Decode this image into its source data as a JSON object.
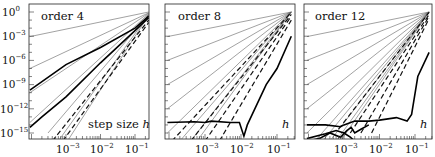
{
  "chart_data": [
    {
      "type": "line",
      "title": "order 4",
      "xlabel": "step size h",
      "ylabel": "",
      "xscale": "log",
      "yscale": "log",
      "xlim": [
        8.5e-05,
        0.25
      ],
      "ylim": [
        1e-16,
        10
      ],
      "x_ticks": [
        "10^-3",
        "10^-2",
        "10^-1"
      ],
      "y_ticks": [
        "10^0",
        "10^-3",
        "10^-6",
        "10^-9",
        "10^-12",
        "10^-15"
      ],
      "grid": false,
      "series": [
        {
          "name": "thin slope 1",
          "style": "thin",
          "slope": 1,
          "x": [
            9e-05,
            0.25
          ],
          "y": [
            0.0009,
            1.0
          ]
        },
        {
          "name": "thin slope 2",
          "style": "thin",
          "slope": 2,
          "x": [
            9e-05,
            0.25
          ],
          "y": [
            1e-07,
            0.8
          ]
        },
        {
          "name": "thin slope 3",
          "style": "thin",
          "slope": 3,
          "x": [
            9e-05,
            0.25
          ],
          "y": [
            1e-10,
            0.7
          ]
        },
        {
          "name": "thin slope 4",
          "style": "thin",
          "slope": 4,
          "x": [
            9e-05,
            0.25
          ],
          "y": [
            2e-14,
            0.6
          ]
        },
        {
          "name": "thin slope 5",
          "style": "thin",
          "slope": 5,
          "x": [
            0.0003,
            0.25
          ],
          "y": [
            1e-15,
            0.5
          ]
        },
        {
          "name": "thin slope 6",
          "style": "thin",
          "slope": 6,
          "x": [
            0.0006,
            0.25
          ],
          "y": [
            1e-16,
            0.5
          ]
        },
        {
          "name": "thin slope 7",
          "style": "thin",
          "slope": 7,
          "x": [
            0.0011,
            0.25
          ],
          "y": [
            1e-16,
            0.4
          ]
        },
        {
          "name": "thick error A",
          "style": "thick",
          "x": [
            9e-05,
            0.001,
            0.01,
            0.1,
            0.25
          ],
          "y": [
            2e-10,
            3e-07,
            4e-05,
            0.01,
            0.3
          ]
        },
        {
          "name": "thick error B",
          "style": "thick",
          "x": [
            9e-05,
            0.0002,
            0.001,
            0.01,
            0.1,
            0.25
          ],
          "y": [
            5e-15,
            1e-13,
            3e-11,
            5e-07,
            0.005,
            0.2
          ]
        },
        {
          "name": "dashed A",
          "style": "dash",
          "x": [
            0.0004,
            0.25
          ],
          "y": [
            1e-16,
            0.1
          ]
        },
        {
          "name": "dashed B",
          "style": "dash",
          "x": [
            0.0008,
            0.25
          ],
          "y": [
            1e-16,
            0.05
          ]
        }
      ]
    },
    {
      "type": "line",
      "title": "order 8",
      "xlabel": "h",
      "xscale": "log",
      "yscale": "log",
      "xlim": [
        8.5e-05,
        0.25
      ],
      "ylim": [
        1e-16,
        10
      ],
      "x_ticks": [
        "10^-3",
        "10^-2",
        "10^-1"
      ],
      "grid": false,
      "series": [
        {
          "name": "thin slope 1",
          "style": "thin",
          "slope": 1,
          "x": [
            9e-05,
            0.25
          ],
          "y": [
            0.0009,
            1.0
          ]
        },
        {
          "name": "thin slope 2",
          "style": "thin",
          "slope": 2,
          "x": [
            9e-05,
            0.25
          ],
          "y": [
            1e-06,
            1.0
          ]
        },
        {
          "name": "thin slope 3",
          "style": "thin",
          "slope": 3,
          "x": [
            9e-05,
            0.25
          ],
          "y": [
            1e-09,
            1.0
          ]
        },
        {
          "name": "thin slope 4",
          "style": "thin",
          "slope": 4,
          "x": [
            9e-05,
            0.25
          ],
          "y": [
            1e-12,
            1.0
          ]
        },
        {
          "name": "thin slope 5",
          "style": "thin",
          "slope": 5,
          "x": [
            9e-05,
            0.25
          ],
          "y": [
            1e-15,
            1.0
          ]
        },
        {
          "name": "thin slope 6",
          "style": "thin",
          "slope": 6,
          "x": [
            0.0002,
            0.25
          ],
          "y": [
            1e-16,
            1.0
          ]
        },
        {
          "name": "thin slope 7",
          "style": "thin",
          "slope": 7,
          "x": [
            0.0004,
            0.25
          ],
          "y": [
            1e-16,
            1.0
          ]
        },
        {
          "name": "thin slope 8",
          "style": "thin",
          "slope": 8,
          "x": [
            0.0006,
            0.25
          ],
          "y": [
            1e-16,
            1.0
          ]
        },
        {
          "name": "dashed A",
          "style": "dash",
          "x": [
            0.00012,
            0.25
          ],
          "y": [
            1e-16,
            0.9
          ]
        },
        {
          "name": "dashed B",
          "style": "dash",
          "x": [
            0.0004,
            0.25
          ],
          "y": [
            1e-16,
            0.5
          ]
        },
        {
          "name": "dashed C",
          "style": "dash",
          "x": [
            0.001,
            0.25
          ],
          "y": [
            1e-16,
            0.3
          ]
        },
        {
          "name": "dashed D",
          "style": "dash",
          "x": [
            0.0025,
            0.25
          ],
          "y": [
            1e-16,
            0.1
          ]
        },
        {
          "name": "thick error",
          "style": "thick",
          "x": [
            9e-05,
            0.0005,
            0.001,
            0.0015,
            0.005,
            0.009,
            0.012,
            0.015,
            0.05,
            0.1,
            0.25
          ],
          "y": [
            2e-14,
            2.5e-14,
            2e-14,
            3e-14,
            2e-14,
            2e-14,
            4e-16,
            1e-14,
            1e-09,
            1e-07,
            0.001
          ]
        }
      ]
    },
    {
      "type": "line",
      "title": "order 12",
      "xlabel": "h",
      "xscale": "log",
      "yscale": "log",
      "xlim": [
        8.5e-05,
        0.25
      ],
      "ylim": [
        1e-16,
        10
      ],
      "x_ticks": [
        "10^-3",
        "10^-2",
        "10^-1"
      ],
      "grid": false,
      "series": [
        {
          "name": "thin slope 1",
          "style": "thin",
          "slope": 1,
          "x": [
            9e-05,
            0.25
          ],
          "y": [
            0.0009,
            1.0
          ]
        },
        {
          "name": "thin slope 2",
          "style": "thin",
          "slope": 2,
          "x": [
            9e-05,
            0.25
          ],
          "y": [
            1e-06,
            1.0
          ]
        },
        {
          "name": "thin slope 3",
          "style": "thin",
          "slope": 3,
          "x": [
            9e-05,
            0.25
          ],
          "y": [
            1e-09,
            1.0
          ]
        },
        {
          "name": "thin slope 4",
          "style": "thin",
          "slope": 4,
          "x": [
            9e-05,
            0.25
          ],
          "y": [
            1e-12,
            1.0
          ]
        },
        {
          "name": "thin slope 5",
          "style": "thin",
          "slope": 5,
          "x": [
            9e-05,
            0.25
          ],
          "y": [
            1e-15,
            1.0
          ]
        },
        {
          "name": "thin slope 6",
          "style": "thin",
          "slope": 6,
          "x": [
            0.00015,
            0.25
          ],
          "y": [
            1e-16,
            1.0
          ]
        },
        {
          "name": "thin slope 7",
          "style": "thin",
          "slope": 7,
          "x": [
            0.00025,
            0.25
          ],
          "y": [
            1e-16,
            1.0
          ]
        },
        {
          "name": "thin slope 8",
          "style": "thin",
          "slope": 8,
          "x": [
            0.0004,
            0.25
          ],
          "y": [
            1e-16,
            1.0
          ]
        },
        {
          "name": "thin slope 9",
          "style": "thin",
          "slope": 9,
          "x": [
            0.0006,
            0.25
          ],
          "y": [
            1e-16,
            1.0
          ]
        },
        {
          "name": "thin slope 10",
          "style": "thin",
          "slope": 10,
          "x": [
            0.0008,
            0.25
          ],
          "y": [
            1e-16,
            1.0
          ]
        },
        {
          "name": "dashed A",
          "style": "dash",
          "x": [
            0.0007,
            0.25
          ],
          "y": [
            3e-15,
            0.9
          ]
        },
        {
          "name": "dashed B",
          "style": "dash",
          "x": [
            0.0015,
            0.25
          ],
          "y": [
            1e-15,
            0.5
          ]
        },
        {
          "name": "dashed C",
          "style": "dash",
          "x": [
            0.003,
            0.25
          ],
          "y": [
            1e-15,
            0.3
          ]
        },
        {
          "name": "dashed D",
          "style": "dash",
          "x": [
            0.006,
            0.25
          ],
          "y": [
            1e-15,
            0.15
          ]
        },
        {
          "name": "thick error A",
          "style": "thick",
          "x": [
            9e-05,
            0.0003,
            0.0008,
            0.001,
            0.002,
            0.005,
            0.01,
            0.03,
            0.06,
            0.08,
            0.12,
            0.25
          ],
          "y": [
            1e-14,
            1e-14,
            6e-15,
            1e-14,
            3e-14,
            3e-14,
            4e-14,
            8e-14,
            3e-14,
            2e-13,
            1e-08,
            1e-05
          ]
        },
        {
          "name": "thick error B",
          "style": "thick",
          "x": [
            9e-05,
            0.0002,
            0.0004,
            0.0008,
            0.0012,
            0.0016,
            0.002,
            0.003,
            0.005
          ],
          "y": [
            1e-16,
            2e-16,
            1e-15,
            3e-16,
            2e-15,
            5e-15,
            1e-15,
            3e-15,
            1e-14
          ]
        },
        {
          "name": "thick error C",
          "style": "thick",
          "x": [
            9e-05,
            0.0003,
            0.0006,
            0.001,
            0.0015,
            0.002
          ],
          "y": [
            2e-16,
            8e-16,
            2e-15,
            1e-15,
            3e-16,
            1e-16
          ]
        }
      ]
    }
  ],
  "panels": [
    {
      "title": "order 4",
      "xlabel_text": "step size ",
      "xlabel_var": "h",
      "ytick_labels": [
        {
          "base": "10",
          "exp": "0"
        },
        {
          "base": "10",
          "exp": "−3"
        },
        {
          "base": "10",
          "exp": "−6"
        },
        {
          "base": "10",
          "exp": "−9"
        },
        {
          "base": "10",
          "exp": "−12"
        },
        {
          "base": "10",
          "exp": "−15"
        }
      ]
    },
    {
      "title": "order 8",
      "xlabel_text": "",
      "xlabel_var": "h"
    },
    {
      "title": "order 12",
      "xlabel_text": "",
      "xlabel_var": "h"
    }
  ],
  "xtick_labels": [
    {
      "base": "10",
      "exp": "−3"
    },
    {
      "base": "10",
      "exp": "−2"
    },
    {
      "base": "10",
      "exp": "−1"
    }
  ]
}
